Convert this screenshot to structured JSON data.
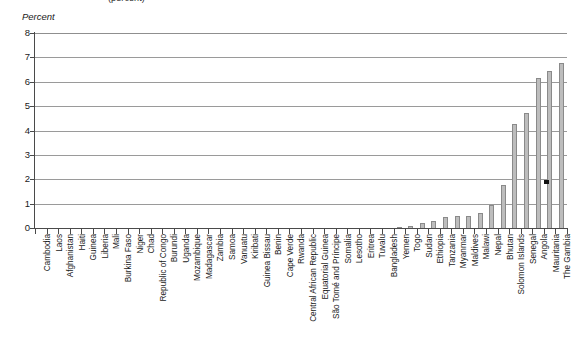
{
  "clipped_title": "(percent)",
  "axis": {
    "y_title": "Percent",
    "y_ticks": [
      8,
      7,
      6,
      5,
      4,
      3,
      2,
      1,
      0
    ],
    "y_min": 0,
    "y_max": 8
  },
  "colors": {
    "bar_fill": "#bdbdbd",
    "bar_stroke": "#8a8a8a",
    "gridline": "#9a9a9a",
    "axis": "#4a4a4a",
    "background": "#ffffff"
  },
  "chart_data": {
    "type": "bar",
    "title": "(percent)",
    "xlabel": "",
    "ylabel": "Percent",
    "ylim": [
      0,
      8
    ],
    "grid": true,
    "legend": null,
    "categories": [
      "Cambodia",
      "Laos",
      "Afghanistan",
      "Haiti",
      "Guinea",
      "Liberia",
      "Mali",
      "Burkina Faso",
      "Niger",
      "Chad",
      "Republic of Congo",
      "Burundi",
      "Uganda",
      "Mozambique",
      "Madagascar",
      "Zambia",
      "Samoa",
      "Vanuatu",
      "Kiribati",
      "Guinea Bissau",
      "Benin",
      "Cape Verde",
      "Rwanda",
      "Central African Republic",
      "Equatorial Guinea",
      "São Tomé and Príncipe",
      "Somalia",
      "Lesotho",
      "Eritrea",
      "Tuvalu",
      "Bangladesh",
      "Yemen",
      "Togo",
      "Sudan",
      "Ethiopia",
      "Tanzania",
      "Myanmar",
      "Maldives",
      "Malawi",
      "Nepal",
      "Bhutan",
      "Solomon Islands",
      "Senegal",
      "Angola",
      "Mauritania",
      "The Gambia"
    ],
    "values": [
      0.0,
      0.0,
      0.0,
      0.0,
      0.0,
      0.0,
      0.0,
      0.0,
      0.0,
      0.0,
      0.0,
      0.0,
      0.0,
      0.0,
      0.0,
      0.0,
      0.0,
      0.0,
      0.0,
      0.0,
      0.0,
      0.0,
      0.0,
      0.0,
      0.0,
      0.0,
      0.0,
      0.0,
      0.0,
      0.0,
      0.0,
      0.05,
      0.1,
      0.2,
      0.3,
      0.45,
      0.5,
      0.5,
      0.6,
      0.95,
      1.75,
      4.25,
      4.7,
      6.15,
      6.45,
      6.75
    ]
  }
}
